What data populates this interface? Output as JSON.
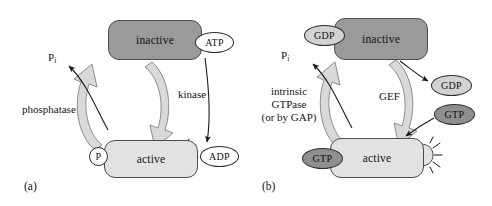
{
  "figure": {
    "type": "two-panel biochemical regulatory cycle diagram",
    "background_color": "#ffffff",
    "panels": [
      {
        "tag": "(a)",
        "name": "phosphorylation-cycle",
        "nodes": [
          {
            "id": "inactive",
            "label": "inactive",
            "fill": "#9a9a9a",
            "state": "inactive"
          },
          {
            "id": "active",
            "label": "active",
            "fill": "#e2e2e2",
            "state": "active"
          }
        ],
        "tokens": [
          {
            "id": "atp",
            "label": "ATP",
            "fill": "#ffffff",
            "shape": "ellipse"
          },
          {
            "id": "adp",
            "label": "ADP",
            "fill": "#ffffff",
            "shape": "ellipse"
          },
          {
            "id": "p-bound",
            "label": "P",
            "fill": "#ffffff",
            "shape": "circle"
          }
        ],
        "labels": {
          "pi": "P",
          "pi_subscript": "i",
          "forward_enzyme": "kinase",
          "reverse_enzyme": "phosphatase"
        }
      },
      {
        "tag": "(b)",
        "name": "gtpase-cycle",
        "nodes": [
          {
            "id": "inactive",
            "label": "inactive",
            "fill": "#9a9a9a",
            "state": "inactive"
          },
          {
            "id": "active",
            "label": "active",
            "fill": "#e2e2e2",
            "state": "active"
          }
        ],
        "tokens": [
          {
            "id": "gdp-bound",
            "label": "GDP",
            "fill": "#d2d2d2",
            "shape": "ellipse"
          },
          {
            "id": "gdp-released",
            "label": "GDP",
            "fill": "#d2d2d2",
            "shape": "ellipse"
          },
          {
            "id": "gtp-in",
            "label": "GTP",
            "fill": "#8f8f8f",
            "shape": "ellipse"
          },
          {
            "id": "gtp-bound",
            "label": "GTP",
            "fill": "#8f8f8f",
            "shape": "ellipse"
          }
        ],
        "labels": {
          "pi": "P",
          "pi_subscript": "i",
          "forward_enzyme": "GEF",
          "reverse_enzyme_line1": "intrinsic",
          "reverse_enzyme_line2": "GTPase",
          "reverse_enzyme_line3": "(or by GAP)"
        }
      }
    ],
    "colors": {
      "inactive_fill": "#9a9a9a",
      "active_fill": "#e2e2e2",
      "block_arrow_fill": "#d9d9d9",
      "block_arrow_stroke": "#8c8c8c",
      "thin_arrow": "#1a1a1a",
      "gdp_fill": "#d2d2d2",
      "gtp_fill": "#8f8f8f",
      "outline": "#4d4d4d"
    }
  }
}
